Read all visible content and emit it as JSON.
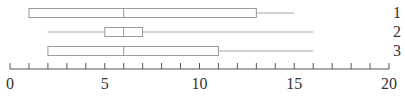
{
  "chart_data": {
    "type": "boxplot",
    "orientation": "horizontal",
    "title": "",
    "xlabel": "",
    "ylabel": "",
    "xlim": [
      0,
      20
    ],
    "x_ticks_major": [
      0,
      5,
      10,
      15,
      20
    ],
    "x_ticks_minor_step": 1,
    "grid": false,
    "series": [
      {
        "name": "1",
        "min": 1,
        "q1": 1,
        "median": 6,
        "q3": 13,
        "max": 15
      },
      {
        "name": "2",
        "min": 2,
        "q1": 5,
        "median": 6,
        "q3": 7,
        "max": 16
      },
      {
        "name": "3",
        "min": 2,
        "q1": 2,
        "median": 6,
        "q3": 11,
        "max": 16
      }
    ]
  },
  "axis": {
    "tick_labels": [
      "0",
      "5",
      "10",
      "15",
      "20"
    ]
  },
  "row_labels": [
    "1",
    "2",
    "3"
  ],
  "colors": {
    "box_stroke": "#9a9a9a",
    "whisker": "#a8a8a8",
    "axis": "#555555",
    "text": "#333333"
  }
}
